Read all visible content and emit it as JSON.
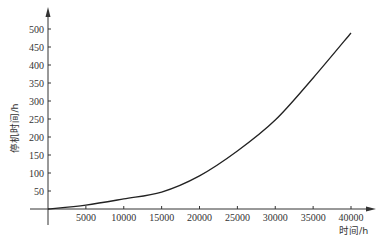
{
  "chart_data": {
    "type": "line",
    "title": "",
    "xlabel": "时间/h",
    "ylabel": "停机时间/h",
    "xlim": [
      0,
      41000
    ],
    "ylim": [
      0,
      520
    ],
    "grid": false,
    "legend": null,
    "x_ticks": [
      5000,
      10000,
      15000,
      20000,
      25000,
      30000,
      35000,
      40000
    ],
    "y_ticks": [
      50,
      100,
      150,
      200,
      250,
      300,
      350,
      400,
      450,
      500
    ],
    "series": [
      {
        "name": "停机时间",
        "color": "#222222",
        "x": [
          0,
          5000,
          10000,
          15000,
          20000,
          25000,
          30000,
          35000,
          40000
        ],
        "y": [
          0,
          11,
          28,
          47,
          92,
          161,
          247,
          364,
          489
        ]
      }
    ]
  }
}
